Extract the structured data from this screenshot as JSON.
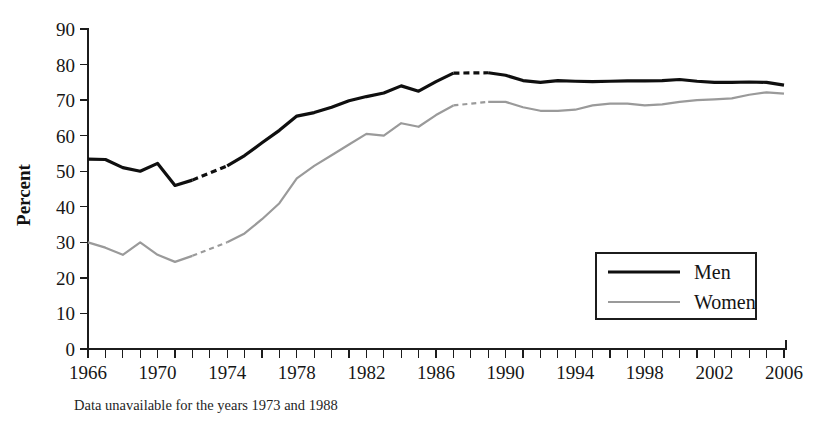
{
  "chart_data": {
    "type": "line",
    "title": "",
    "xlabel": "",
    "ylabel": "Percent",
    "xlim": [
      1966,
      2006
    ],
    "ylim": [
      0,
      90
    ],
    "grid": false,
    "legend_position": "inside-bottom-right",
    "y_ticks": [
      0,
      10,
      20,
      30,
      40,
      50,
      60,
      70,
      80,
      90
    ],
    "x_ticks_labeled": [
      1966,
      1970,
      1974,
      1978,
      1982,
      1986,
      1990,
      1994,
      1998,
      2002,
      2006
    ],
    "x_tick_step_minor": 1,
    "annotation": "Data unavailable for the years 1973 and 1988",
    "missing_years": [
      1973,
      1988
    ],
    "x": [
      1966,
      1967,
      1968,
      1969,
      1970,
      1971,
      1972,
      1974,
      1975,
      1976,
      1977,
      1978,
      1979,
      1980,
      1981,
      1982,
      1983,
      1984,
      1985,
      1986,
      1987,
      1989,
      1990,
      1991,
      1992,
      1993,
      1994,
      1995,
      1996,
      1997,
      1998,
      1999,
      2000,
      2001,
      2002,
      2003,
      2004,
      2005,
      2006
    ],
    "series": [
      {
        "name": "Men",
        "color": "#0f0f0f",
        "style": "solid-thick",
        "values": [
          53.4,
          53.3,
          51.0,
          50.0,
          52.2,
          46.0,
          47.5,
          51.5,
          54.4,
          58.0,
          61.5,
          65.5,
          66.5,
          68.0,
          69.8,
          71.0,
          72.0,
          74.0,
          72.5,
          75.2,
          77.6,
          77.7,
          77.0,
          75.5,
          75.0,
          75.5,
          75.3,
          75.2,
          75.3,
          75.4,
          75.4,
          75.5,
          75.8,
          75.3,
          75.0,
          75.0,
          75.1,
          75.0,
          74.2
        ]
      },
      {
        "name": "Women",
        "color": "#9a9a9a",
        "style": "solid-thin",
        "values": [
          30.0,
          28.5,
          26.5,
          30.0,
          26.5,
          24.5,
          26.2,
          30.0,
          32.5,
          36.5,
          41.0,
          48.0,
          51.5,
          54.5,
          57.5,
          60.5,
          60.0,
          63.5,
          62.5,
          65.8,
          68.5,
          69.5,
          69.5,
          68.0,
          67.0,
          67.0,
          67.3,
          68.5,
          69.0,
          69.0,
          68.5,
          68.8,
          69.5,
          70.0,
          70.2,
          70.5,
          71.5,
          72.2,
          71.8
        ]
      }
    ]
  },
  "legend": {
    "items": [
      {
        "label": "Men"
      },
      {
        "label": "Women"
      }
    ]
  },
  "footnote": {
    "text": "Data unavailable for the years 1973 and 1988"
  },
  "axes": {
    "y_title": "Percent"
  }
}
